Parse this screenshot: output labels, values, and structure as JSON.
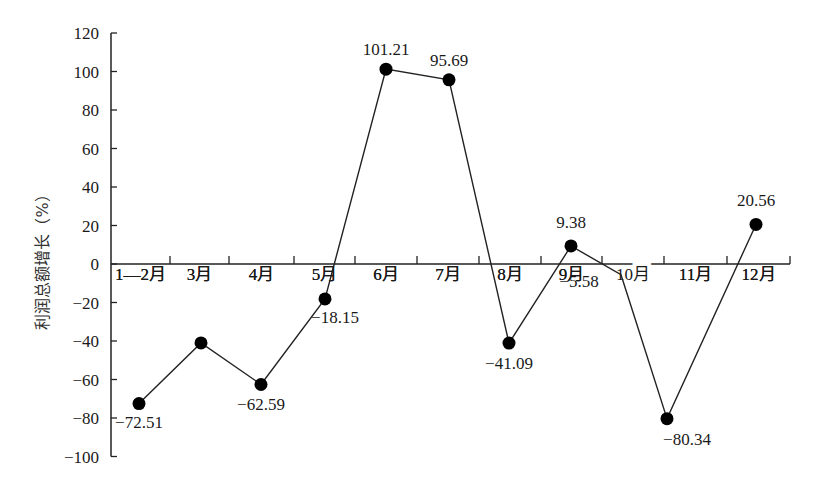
{
  "chart_data": {
    "type": "line",
    "title": "",
    "xlabel": "",
    "ylabel": "利润总额增长（%）",
    "categories": [
      "1—2月",
      "3月",
      "4月",
      "5月",
      "6月",
      "7月",
      "8月",
      "9月",
      "10月",
      "11月",
      "12月"
    ],
    "values": [
      -72.51,
      -41.0,
      -62.59,
      -18.15,
      101.21,
      95.69,
      -41.09,
      9.38,
      -5.58,
      -80.34,
      20.56
    ],
    "data_labels": [
      "-72.51",
      "",
      "-62.59",
      "-18.15",
      "101.21",
      "95.69",
      "-41.09",
      "9.38",
      "-5.58",
      "-80.34",
      "20.56"
    ],
    "ylim": [
      -100,
      120
    ],
    "yticks": [
      120,
      100,
      80,
      60,
      40,
      20,
      0,
      -20,
      -40,
      -60,
      -80,
      -100
    ],
    "grid": false,
    "legend": null,
    "colors": {
      "line": "#222222",
      "marker": "#000000",
      "axis": "#222222"
    }
  },
  "axis": {
    "y_ticks": [
      "120",
      "100",
      "80",
      "60",
      "40",
      "20",
      "0",
      "-20",
      "-40",
      "-60",
      "-80",
      "-100"
    ],
    "ylabel": "利润总额增长（%）"
  }
}
